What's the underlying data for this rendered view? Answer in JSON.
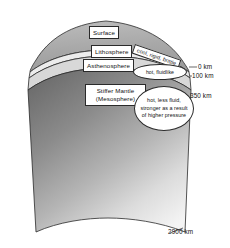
{
  "figure": {
    "background_color": "#ffffff",
    "outline_color": "#2a2a2a"
  },
  "layers": [
    {
      "id": "surface",
      "label": "Surface",
      "fill_color": "#b0b0b0"
    },
    {
      "id": "lithosphere",
      "label": "Lithosphere",
      "fill_color": "#e8e8e8"
    },
    {
      "id": "asthenosphere",
      "label": "Asthenosphere",
      "fill_color": "#d6d6d6"
    },
    {
      "id": "mesosphere",
      "label_line1": "Stiffer Mantle",
      "label_line2": "(Mesosphere)",
      "fill_color_top": "#6e6e6e",
      "fill_color_bottom": "#f2f2f2"
    }
  ],
  "annotations": {
    "lithosphere": "cool, rigid, brittle",
    "asthenosphere": "hot, fluidlike",
    "mesosphere": "hot, less fluid, stronger as a result of higher pressure"
  },
  "depth_markers": [
    {
      "id": "depth-0",
      "value": "0 km"
    },
    {
      "id": "depth-100",
      "value": "100 km"
    },
    {
      "id": "depth-350",
      "value": "350 km"
    },
    {
      "id": "depth-2900",
      "value": "2900 km"
    }
  ]
}
